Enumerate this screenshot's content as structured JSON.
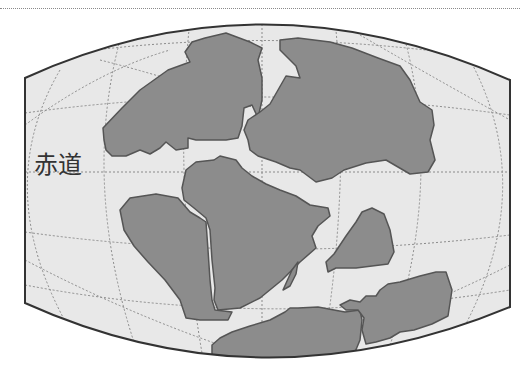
{
  "map": {
    "title": "",
    "labels": {
      "equator": "赤道"
    },
    "colors": {
      "ocean": "#e8e8e8",
      "land": "#8c8c8c",
      "land_outline": "#555555",
      "frame": "#333333",
      "graticule": "#8a8a8a",
      "background": "#ffffff"
    },
    "projection": "pseudo-cylindrical (curved top/bottom)",
    "landmasses": [
      "north-west-continent",
      "north-east-continent",
      "central-continent",
      "south-west-continent",
      "east-island",
      "small-island",
      "south-continent",
      "south-east-continent"
    ]
  }
}
